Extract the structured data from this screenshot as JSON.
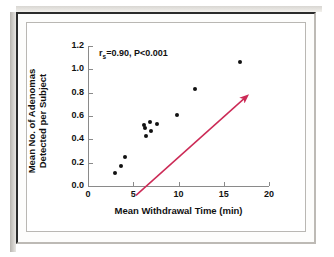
{
  "figure": {
    "background_color": "#ffffff",
    "frame_color": "#2b2b2b",
    "panel_border_color": "#b9b7b3"
  },
  "chart_data": {
    "type": "scatter",
    "title": "",
    "xlabel": "Mean Withdrawal Time (min)",
    "ylabel": "Mean No. of Adenomas Detected per Subject",
    "ylabel_line1": "Mean No. of Adenomas",
    "ylabel_line2": "Detected per Subject",
    "xlim": [
      0,
      20
    ],
    "ylim": [
      0.0,
      1.2
    ],
    "xticks": [
      0,
      5,
      10,
      15,
      20
    ],
    "xtick_labels": [
      "0",
      "5",
      "10",
      "15",
      "20"
    ],
    "yticks": [
      0.0,
      0.2,
      0.4,
      0.6,
      0.8,
      1.0,
      1.2
    ],
    "ytick_labels": [
      "0.0",
      "0.2",
      "0.4",
      "0.6",
      "0.8",
      "1.0",
      "1.2"
    ],
    "grid": false,
    "legend": null,
    "marker_color": "#111111",
    "points": [
      {
        "x": 3.0,
        "y": 0.11
      },
      {
        "x": 3.7,
        "y": 0.17
      },
      {
        "x": 4.1,
        "y": 0.25
      },
      {
        "x": 6.2,
        "y": 0.52
      },
      {
        "x": 6.3,
        "y": 0.5
      },
      {
        "x": 6.45,
        "y": 0.43
      },
      {
        "x": 6.85,
        "y": 0.55
      },
      {
        "x": 6.95,
        "y": 0.47
      },
      {
        "x": 7.65,
        "y": 0.53
      },
      {
        "x": 9.8,
        "y": 0.61
      },
      {
        "x": 11.8,
        "y": 0.83
      },
      {
        "x": 16.8,
        "y": 1.06
      }
    ],
    "annotations": [
      {
        "name": "correlation-annotation",
        "text_prefix": "r",
        "text_sub": "s",
        "text_suffix": "=0.90,  P<0.001",
        "full_text": "rs=0.90, P<0.001",
        "x": 2.0,
        "y": 1.15
      }
    ],
    "trend_arrow": {
      "color": "#cc2a56",
      "x_start": 5.3,
      "y_start": -0.08,
      "x_end": 17.4,
      "y_end": 0.76,
      "has_arrowhead": true
    }
  }
}
